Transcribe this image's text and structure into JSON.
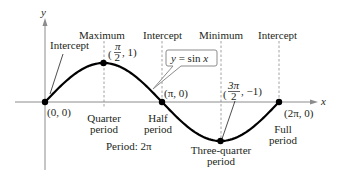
{
  "chart_data": {
    "type": "line",
    "title": "",
    "function_label": "y = sin x",
    "xlabel": "x",
    "ylabel": "y",
    "xlim": [
      0,
      6.2832
    ],
    "ylim": [
      -1,
      1
    ],
    "grid": false,
    "series": [
      {
        "name": "y = sin x",
        "function": "sin",
        "x_range": [
          0,
          6.2832
        ]
      }
    ],
    "key_points": [
      {
        "x": 0,
        "y": 0,
        "coord_label": "(0, 0)",
        "type_label": "Intercept",
        "period_label": ""
      },
      {
        "x": 1.5708,
        "y": 1,
        "coord_label": "(π/2, 1)",
        "type_label": "Maximum",
        "period_label": "Quarter period"
      },
      {
        "x": 3.1416,
        "y": 0,
        "coord_label": "(π, 0)",
        "type_label": "Intercept",
        "period_label": "Half period"
      },
      {
        "x": 4.7124,
        "y": -1,
        "coord_label": "(3π/2, −1)",
        "type_label": "Minimum",
        "period_label": "Three-quarter period"
      },
      {
        "x": 6.2832,
        "y": 0,
        "coord_label": "(2π, 0)",
        "type_label": "Intercept",
        "period_label": "Full period"
      }
    ],
    "annotations": {
      "period_text": "Period: 2π"
    }
  },
  "labels": {
    "y_axis": "y",
    "x_axis": "x",
    "intercept_1": "Intercept",
    "maximum": "Maximum",
    "intercept_2": "Intercept",
    "minimum": "Minimum",
    "intercept_3": "Intercept",
    "callout": "y = sin x",
    "pt0": "(0, 0)",
    "pt_pi": "(π, 0)",
    "pt_2pi": "(2π, 0)",
    "max_open": "(",
    "max_num": "π",
    "max_den": "2",
    "max_rest": ", 1)",
    "min_num": "3π",
    "min_den": "2",
    "min_rest": ", −1)",
    "quarter_1": "Quarter",
    "quarter_2": "period",
    "half_1": "Half",
    "half_2": "period",
    "threeq_1": "Three-quarter",
    "threeq_2": "period",
    "full_1": "Full",
    "full_2": "period",
    "period": "Period: 2π"
  }
}
